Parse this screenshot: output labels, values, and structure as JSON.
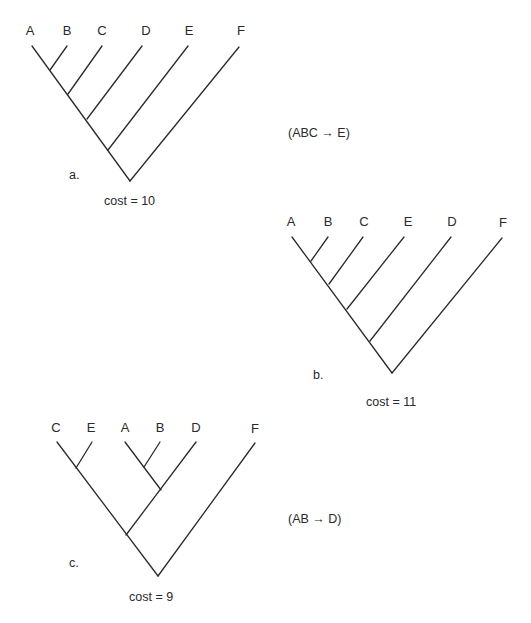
{
  "figure": {
    "trees": [
      {
        "id": "a",
        "panel_label": "a.",
        "cost_text": "cost = 10",
        "annotation": "(ABC → E)",
        "taxa": [
          "A",
          "B",
          "C",
          "D",
          "E",
          "F"
        ],
        "newick": "(((((A,B),C),D),E),F)"
      },
      {
        "id": "b",
        "panel_label": "b.",
        "cost_text": "cost = 11",
        "annotation": "",
        "taxa": [
          "A",
          "B",
          "C",
          "E",
          "D",
          "F"
        ],
        "newick": "(((((A,B),C),E),D),F)"
      },
      {
        "id": "c",
        "panel_label": "c.",
        "cost_text": "cost = 9",
        "annotation": "(AB → D)",
        "taxa": [
          "C",
          "E",
          "A",
          "B",
          "D",
          "F"
        ],
        "newick": "(((C,E),((A,B),D)),F)"
      }
    ],
    "colors": {
      "line": "#2a2a2a",
      "text": "#2a2a2a",
      "background": "#ffffff"
    }
  }
}
